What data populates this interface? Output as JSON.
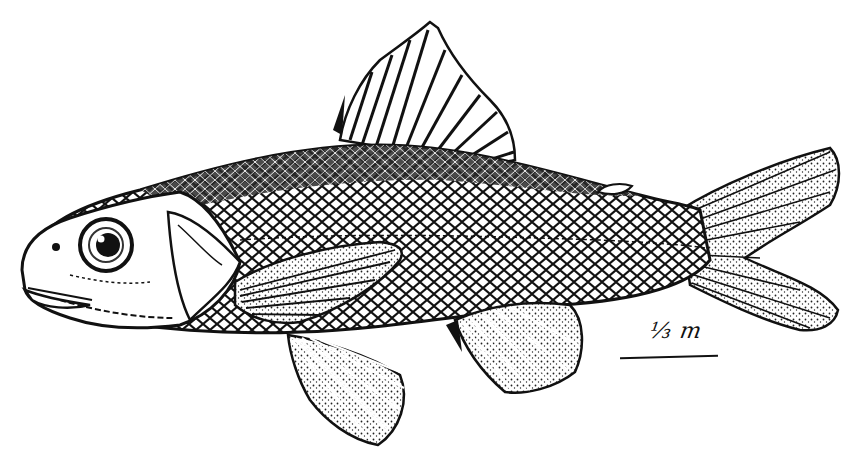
{
  "illustration": {
    "subject": "fish",
    "style": "black-and-white engraving",
    "orientation": "facing left",
    "parts": [
      "head",
      "eye",
      "mouth",
      "operculum",
      "body-scales",
      "lateral-line",
      "dorsal-fin",
      "adipose-fin",
      "pectoral-fin",
      "pelvic-fin",
      "anal-fin",
      "caudal-fin"
    ]
  },
  "scale": {
    "label": "⅓ m"
  },
  "colors": {
    "ink": "#111111",
    "paper": "#ffffff"
  }
}
